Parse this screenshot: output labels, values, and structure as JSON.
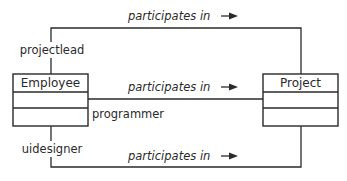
{
  "diagram": {
    "type": "UML class diagram",
    "classes": [
      {
        "id": "employee",
        "name": "Employee"
      },
      {
        "id": "project",
        "name": "Project"
      }
    ],
    "associations": [
      {
        "role": "projectlead",
        "name": "participates in",
        "direction": "right"
      },
      {
        "role": "programmer",
        "name": "participates in",
        "direction": "right"
      },
      {
        "role": "uidesigner",
        "name": "participates in",
        "direction": "right"
      }
    ]
  }
}
